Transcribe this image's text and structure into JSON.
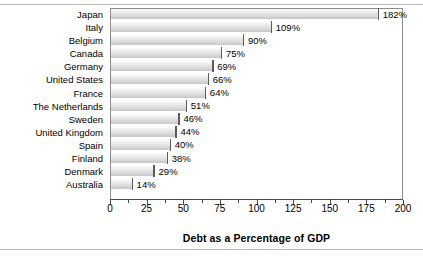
{
  "chart_data": {
    "type": "bar",
    "orientation": "horizontal",
    "title": "",
    "xlabel": "Debt as a Percentage of GDP",
    "ylabel": "",
    "xlim": [
      0,
      200
    ],
    "xticks": [
      0,
      25,
      50,
      75,
      100,
      125,
      150,
      175,
      200
    ],
    "xtick_labels": [
      "0",
      "25",
      "50",
      "75",
      "100",
      "125",
      "150",
      "175",
      "200"
    ],
    "minor_tick_step": 12.5,
    "grid": false,
    "legend": false,
    "value_label_suffix": "%",
    "categories": [
      "Japan",
      "Italy",
      "Belgium",
      "Canada",
      "Germany",
      "United States",
      "France",
      "The Netherlands",
      "Sweden",
      "United Kingdom",
      "Spain",
      "Finland",
      "Denmark",
      "Australia"
    ],
    "values": [
      182,
      109,
      90,
      75,
      69,
      66,
      64,
      51,
      46,
      44,
      40,
      38,
      29,
      14
    ],
    "value_labels": [
      "182%",
      "109%",
      "90%",
      "75%",
      "69%",
      "66%",
      "64%",
      "51%",
      "46%",
      "44%",
      "40%",
      "38%",
      "29%",
      "14%"
    ],
    "colors": {
      "bar_light": "#fbfbfb",
      "bar_dark": "#c6c6c6",
      "bar_cap": "#5c5c5c",
      "axis": "#4a4a4a",
      "frame": "#8d8d8d",
      "rule": "#b9b9b9",
      "text": "#000000",
      "background": "#ffffff"
    }
  }
}
